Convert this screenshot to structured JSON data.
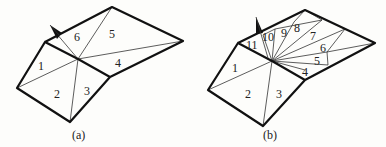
{
  "figure_a": {
    "caption": "(a)",
    "labels": [
      "1",
      "2",
      "3",
      "4",
      "5",
      "6"
    ]
  },
  "figure_b": {
    "caption": "(b)",
    "labels": [
      "1",
      "2",
      "3",
      "4",
      "5",
      "6",
      "7",
      "8",
      "9",
      "10",
      "11"
    ]
  },
  "colors": {
    "line": "#111111",
    "background": "#fdfdfb"
  }
}
